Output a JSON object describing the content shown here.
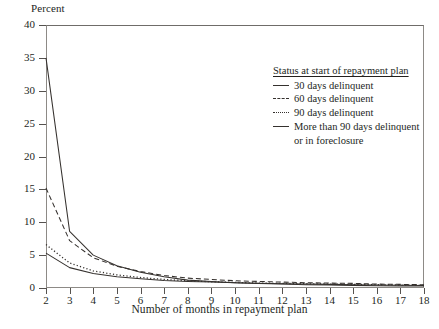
{
  "axis": {
    "y_title": "Percent",
    "x_title": "Number of months in repayment plan",
    "y_ticks": [
      "0",
      "5",
      "10",
      "15",
      "20",
      "25",
      "30",
      "35",
      "40"
    ],
    "x_ticks": [
      "2",
      "3",
      "4",
      "5",
      "6",
      "7",
      "8",
      "9",
      "10",
      "11",
      "12",
      "13",
      "14",
      "15",
      "16",
      "17",
      "18"
    ]
  },
  "legend": {
    "title": "Status at start of repayment plan",
    "items": [
      {
        "label": "30 days delinquent",
        "style": "solid"
      },
      {
        "label": "60 days delinquent",
        "style": "dash"
      },
      {
        "label": "90 days delinquent",
        "style": "dot"
      },
      {
        "label": "More than 90 days delinquent",
        "label2": "or in foreclosure",
        "style": "solid"
      }
    ]
  },
  "chart_data": {
    "type": "line",
    "title": "",
    "xlabel": "Number of months in repayment plan",
    "ylabel": "Percent",
    "xlim": [
      2,
      18
    ],
    "ylim": [
      0,
      40
    ],
    "ytick_step": 5,
    "grid": false,
    "legend_position": "upper-right",
    "x": [
      2,
      3,
      4,
      5,
      6,
      7,
      8,
      9,
      10,
      11,
      12,
      13,
      14,
      15,
      16,
      17,
      18
    ],
    "series": [
      {
        "name": "30 days delinquent",
        "style": "solid",
        "color": "#35312e",
        "values": [
          35.0,
          8.6,
          5.0,
          3.4,
          2.4,
          1.7,
          1.2,
          1.0,
          0.8,
          0.7,
          0.6,
          0.5,
          0.45,
          0.4,
          0.35,
          0.3,
          0.3
        ]
      },
      {
        "name": "60 days delinquent",
        "style": "dash",
        "color": "#35312e",
        "values": [
          15.2,
          7.2,
          4.6,
          3.3,
          2.5,
          1.9,
          1.5,
          1.3,
          1.1,
          1.0,
          0.9,
          0.8,
          0.75,
          0.7,
          0.6,
          0.55,
          0.5
        ]
      },
      {
        "name": "90 days delinquent",
        "style": "dot",
        "color": "#35312e",
        "values": [
          6.6,
          3.8,
          2.6,
          2.0,
          1.6,
          1.3,
          1.1,
          0.95,
          0.85,
          0.75,
          0.7,
          0.65,
          0.6,
          0.55,
          0.5,
          0.45,
          0.4
        ]
      },
      {
        "name": "More than 90 days delinquent or in foreclosure",
        "style": "solid",
        "color": "#35312e",
        "values": [
          5.3,
          3.1,
          2.2,
          1.7,
          1.4,
          1.15,
          1.0,
          0.9,
          0.8,
          0.72,
          0.66,
          0.6,
          0.55,
          0.5,
          0.46,
          0.42,
          0.38
        ]
      }
    ]
  }
}
